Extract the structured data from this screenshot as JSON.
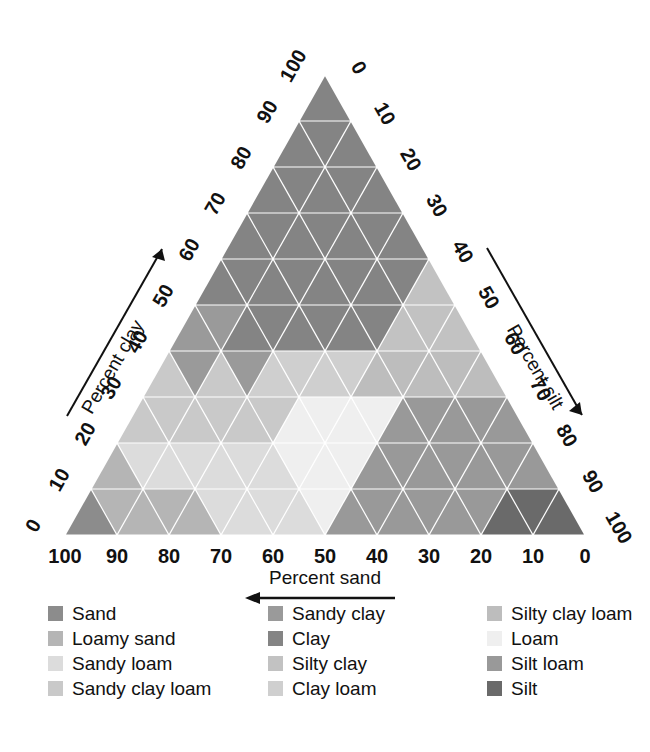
{
  "chart_data": {
    "type": "ternary",
    "axes": {
      "bottom": {
        "label": "Percent sand",
        "ticks": [
          100,
          90,
          80,
          70,
          60,
          50,
          40,
          30,
          20,
          10,
          0
        ],
        "direction": "right-to-left",
        "arrow": "left"
      },
      "left": {
        "label": "Percent clay",
        "ticks": [
          0,
          10,
          20,
          30,
          40,
          50,
          60,
          70,
          80,
          90,
          100
        ],
        "direction": "bottom-to-top",
        "arrow": "up"
      },
      "right": {
        "label": "Percent silt",
        "ticks": [
          0,
          10,
          20,
          30,
          40,
          50,
          60,
          70,
          80,
          90,
          100
        ],
        "direction": "top-to-bottom",
        "arrow": "down"
      }
    },
    "legend_position": "below",
    "classes": [
      {
        "name": "Sand",
        "color": "#8c8c8c"
      },
      {
        "name": "Loamy sand",
        "color": "#b5b5b5"
      },
      {
        "name": "Sandy loam",
        "color": "#dcdcdc"
      },
      {
        "name": "Sandy clay loam",
        "color": "#c9c9c9"
      },
      {
        "name": "Sandy clay",
        "color": "#9a9a9a"
      },
      {
        "name": "Clay",
        "color": "#848484"
      },
      {
        "name": "Silty clay",
        "color": "#c2c2c2"
      },
      {
        "name": "Clay loam",
        "color": "#cfcfcf"
      },
      {
        "name": "Silty clay loam",
        "color": "#bdbdbd"
      },
      {
        "name": "Loam",
        "color": "#efefef"
      },
      {
        "name": "Silt loam",
        "color": "#999999"
      },
      {
        "name": "Silt",
        "color": "#6a6a6a"
      }
    ]
  },
  "legend": {
    "col1": [
      {
        "name": "Sand",
        "color": "#8c8c8c"
      },
      {
        "name": "Loamy sand",
        "color": "#b5b5b5"
      },
      {
        "name": "Sandy loam",
        "color": "#dcdcdc"
      },
      {
        "name": "Sandy clay loam",
        "color": "#c9c9c9"
      }
    ],
    "col2": [
      {
        "name": "Sandy clay",
        "color": "#9a9a9a"
      },
      {
        "name": "Clay",
        "color": "#848484"
      },
      {
        "name": "Silty clay",
        "color": "#c2c2c2"
      },
      {
        "name": "Clay loam",
        "color": "#cfcfcf"
      }
    ],
    "col3": [
      {
        "name": "Silty clay loam",
        "color": "#bdbdbd"
      },
      {
        "name": "Loam",
        "color": "#efefef"
      },
      {
        "name": "Silt loam",
        "color": "#999999"
      },
      {
        "name": "Silt",
        "color": "#6a6a6a"
      }
    ]
  },
  "axis_titles": {
    "sand": "Percent sand",
    "clay": "Percent clay",
    "silt": "Percent silt"
  },
  "bottom_ticks": [
    "100",
    "90",
    "80",
    "70",
    "60",
    "50",
    "40",
    "30",
    "20",
    "10",
    "0"
  ],
  "left_ticks": [
    "0",
    "10",
    "20",
    "30",
    "40",
    "50",
    "60",
    "70",
    "80",
    "90",
    "100"
  ],
  "right_ticks": [
    "0",
    "10",
    "20",
    "30",
    "40",
    "50",
    "60",
    "70",
    "80",
    "90",
    "100"
  ]
}
